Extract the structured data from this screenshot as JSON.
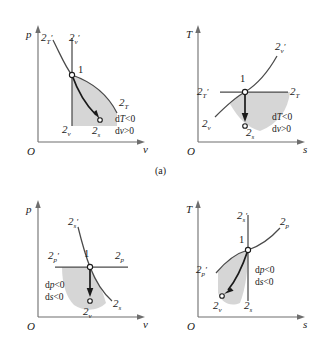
{
  "figure": {
    "caption": "(a)",
    "panels": [
      {
        "id": "panel-a-pv",
        "diagram_type": "p-v",
        "y_axis_label": "p",
        "x_axis_label": "v",
        "origin_label": "O",
        "point_label": "1",
        "conditions": [
          "dT<0",
          "dv>0"
        ],
        "condition_parts": [
          {
            "pre": "d",
            "italic": "T",
            "post": "<0"
          },
          {
            "pre": "d",
            "italic": "v",
            "post": ">0"
          }
        ],
        "curve_labels": [
          {
            "name": "2T-prime",
            "base": "2",
            "sub": "T",
            "prime": "′"
          },
          {
            "name": "2v-prime",
            "base": "2",
            "sub": "v",
            "prime": "′"
          },
          {
            "name": "2T",
            "base": "2",
            "sub": "T",
            "prime": ""
          },
          {
            "name": "2v",
            "base": "2",
            "sub": "v",
            "prime": ""
          },
          {
            "name": "2s",
            "base": "2",
            "sub": "s",
            "prime": ""
          }
        ]
      },
      {
        "id": "panel-a-ts",
        "diagram_type": "T-s",
        "y_axis_label": "T",
        "x_axis_label": "s",
        "origin_label": "O",
        "point_label": "1",
        "conditions": [
          "dT<0",
          "dv>0"
        ],
        "condition_parts": [
          {
            "pre": "d",
            "italic": "T",
            "post": "<0"
          },
          {
            "pre": "d",
            "italic": "v",
            "post": ">0"
          }
        ],
        "curve_labels": [
          {
            "name": "2v-prime",
            "base": "2",
            "sub": "v",
            "prime": "′"
          },
          {
            "name": "2T-prime",
            "base": "2",
            "sub": "T",
            "prime": "′"
          },
          {
            "name": "2T",
            "base": "2",
            "sub": "T",
            "prime": ""
          },
          {
            "name": "2v",
            "base": "2",
            "sub": "v",
            "prime": ""
          },
          {
            "name": "2s",
            "base": "2",
            "sub": "s",
            "prime": ""
          }
        ]
      },
      {
        "id": "panel-b-pv",
        "diagram_type": "p-v",
        "y_axis_label": "p",
        "x_axis_label": "v",
        "origin_label": "O",
        "point_label": "1",
        "conditions": [
          "dp<0",
          "ds<0"
        ],
        "condition_parts": [
          {
            "pre": "d",
            "italic": "p",
            "post": "<0"
          },
          {
            "pre": "d",
            "italic": "s",
            "post": "<0"
          }
        ],
        "curve_labels": [
          {
            "name": "2s-prime",
            "base": "2",
            "sub": "s",
            "prime": "′"
          },
          {
            "name": "2p-prime",
            "base": "2",
            "sub": "p",
            "prime": "′"
          },
          {
            "name": "2p",
            "base": "2",
            "sub": "p",
            "prime": ""
          },
          {
            "name": "2s",
            "base": "2",
            "sub": "s",
            "prime": ""
          },
          {
            "name": "2v",
            "base": "2",
            "sub": "v",
            "prime": ""
          }
        ]
      },
      {
        "id": "panel-b-ts",
        "diagram_type": "T-s",
        "y_axis_label": "T",
        "x_axis_label": "s",
        "origin_label": "O",
        "point_label": "1",
        "conditions": [
          "dp<0",
          "ds<0"
        ],
        "condition_parts": [
          {
            "pre": "d",
            "italic": "p",
            "post": "<0"
          },
          {
            "pre": "d",
            "italic": "s",
            "post": "<0"
          }
        ],
        "curve_labels": [
          {
            "name": "2s-prime",
            "base": "2",
            "sub": "s",
            "prime": "′"
          },
          {
            "name": "2p",
            "base": "2",
            "sub": "p",
            "prime": ""
          },
          {
            "name": "2p-prime",
            "base": "2",
            "sub": "p",
            "prime": "′"
          },
          {
            "name": "2v",
            "base": "2",
            "sub": "v",
            "prime": ""
          },
          {
            "name": "2s",
            "base": "2",
            "sub": "s",
            "prime": ""
          }
        ]
      }
    ]
  },
  "colors": {
    "shade": "#d2d2d2",
    "curve": "#4a4a4a",
    "axis": "#6e6e6e",
    "arrow": "#1a1a1a",
    "text": "#1a1a1a",
    "background": "#ffffff"
  },
  "labels": {
    "p": "p",
    "T": "T",
    "v": "v",
    "s": "s",
    "O": "O",
    "one": "1",
    "two": "2",
    "prime": "′",
    "sub_T": "T",
    "sub_v": "v",
    "sub_s": "s",
    "sub_p": "p",
    "d": "d",
    "lt0": "<0",
    "gt0": ">0",
    "caption_a": "(a)"
  }
}
